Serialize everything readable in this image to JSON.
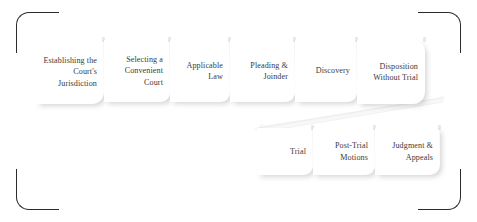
{
  "diagram": {
    "frame": {
      "bracket_color": "#2b2b2b",
      "corner_names": [
        "top-left",
        "top-right",
        "bottom-left",
        "bottom-right"
      ]
    },
    "box_style": {
      "fill": "#ffffff",
      "text_color": "#3a3a3a",
      "shadow_color": "#787878"
    },
    "rows": [
      {
        "name": "pretrial-row",
        "steps": [
          {
            "label": "Establishing the Court's Jurisdiction"
          },
          {
            "label": "Selecting a Convenient Court"
          },
          {
            "label": "Applicable Law"
          },
          {
            "label": "Pleading & Joinder"
          },
          {
            "label": "Discovery"
          },
          {
            "label": "Disposition Without Trial"
          }
        ]
      },
      {
        "name": "trial-row",
        "steps": [
          {
            "label": "Trial"
          },
          {
            "label": "Post-Trial Motions"
          },
          {
            "label": "Judgment & Appeals"
          }
        ]
      }
    ],
    "connector": {
      "name": "row-wrap-connector",
      "from": "Disposition Without Trial",
      "to": "Trial"
    }
  }
}
